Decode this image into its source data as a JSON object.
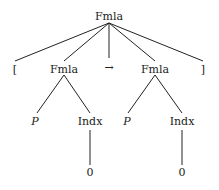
{
  "tree": {
    "root": {
      "label": "Fmla"
    },
    "level1": [
      {
        "label": "["
      },
      {
        "label": "Fmla"
      },
      {
        "label": "→"
      },
      {
        "label": "Fmla"
      },
      {
        "label": "]"
      }
    ],
    "level2_left": [
      {
        "label": "P"
      },
      {
        "label": "Indx"
      }
    ],
    "level2_right": [
      {
        "label": "P"
      },
      {
        "label": "Indx"
      }
    ],
    "leaf_left": {
      "label": "0"
    },
    "leaf_right": {
      "label": "0"
    }
  },
  "colors": {
    "line": "#222222",
    "text": "#222222"
  }
}
